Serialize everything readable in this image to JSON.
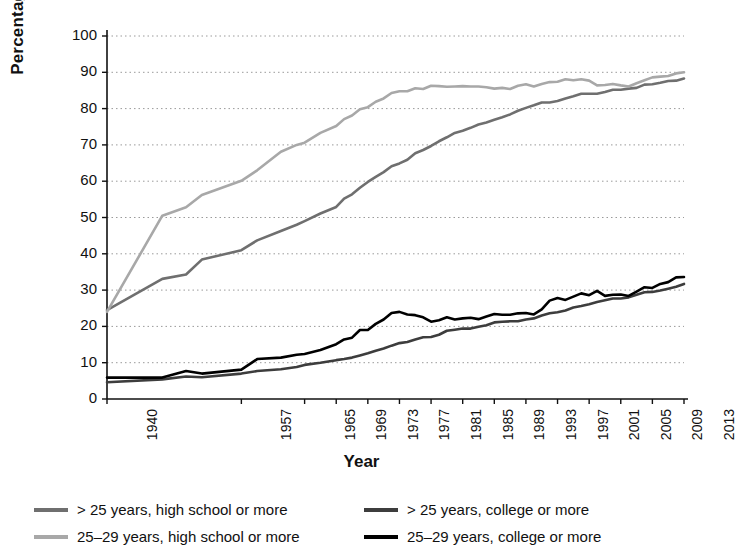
{
  "chart_data": {
    "type": "line",
    "title": "",
    "xlabel": "Year",
    "ylabel": "Percentage",
    "ylim": [
      0,
      100
    ],
    "ytick_labels": [
      "0",
      "10",
      "20",
      "30",
      "40",
      "50",
      "60",
      "70",
      "80",
      "90",
      "100"
    ],
    "ytick_values": [
      0,
      10,
      20,
      30,
      40,
      50,
      60,
      70,
      80,
      90,
      100
    ],
    "xtick_labels": [
      "1940",
      "1957",
      "1965",
      "1969",
      "1973",
      "1977",
      "1981",
      "1985",
      "1989",
      "1993",
      "1997",
      "2001",
      "2005",
      "2009",
      "2013"
    ],
    "xtick_values": [
      1940,
      1957,
      1965,
      1969,
      1973,
      1977,
      1981,
      1985,
      1989,
      1993,
      1997,
      2001,
      2005,
      2009,
      2013
    ],
    "xlim": [
      1940,
      2013
    ],
    "grid": "horizontal-dotted",
    "legend_position": "bottom",
    "series": [
      {
        "name": "> 25 years, high school or more",
        "color": "#6f6f6f",
        "x": [
          1940,
          1947,
          1950,
          1952,
          1957,
          1959,
          1962,
          1964,
          1965,
          1967,
          1969,
          1970,
          1971,
          1972,
          1973,
          1974,
          1975,
          1976,
          1977,
          1978,
          1979,
          1980,
          1981,
          1982,
          1983,
          1984,
          1985,
          1986,
          1987,
          1988,
          1989,
          1990,
          1991,
          1992,
          1993,
          1994,
          1995,
          1996,
          1997,
          1998,
          1999,
          2000,
          2001,
          2002,
          2003,
          2004,
          2005,
          2006,
          2007,
          2008,
          2009,
          2010,
          2011,
          2012,
          2013
        ],
        "values": [
          24.5,
          33.1,
          34.3,
          38.4,
          41.0,
          43.7,
          46.3,
          48.0,
          49.0,
          51.1,
          52.9,
          55.2,
          56.4,
          58.2,
          59.8,
          61.2,
          62.5,
          64.1,
          64.9,
          65.9,
          67.7,
          68.6,
          69.7,
          71.0,
          72.1,
          73.3,
          73.9,
          74.7,
          75.6,
          76.2,
          76.9,
          77.6,
          78.4,
          79.4,
          80.2,
          80.9,
          81.7,
          81.7,
          82.1,
          82.8,
          83.4,
          84.1,
          84.1,
          84.1,
          84.6,
          85.2,
          85.2,
          85.5,
          85.7,
          86.6,
          86.7,
          87.1,
          87.6,
          87.7,
          88.3
        ]
      },
      {
        "name": "25–29 years, high school or more",
        "color": "#a8a8a8",
        "x": [
          1940,
          1947,
          1950,
          1952,
          1957,
          1959,
          1962,
          1964,
          1965,
          1967,
          1969,
          1970,
          1971,
          1972,
          1973,
          1974,
          1975,
          1976,
          1977,
          1978,
          1979,
          1980,
          1981,
          1982,
          1983,
          1984,
          1985,
          1986,
          1987,
          1988,
          1989,
          1990,
          1991,
          1992,
          1993,
          1994,
          1995,
          1996,
          1997,
          1998,
          1999,
          2000,
          2001,
          2002,
          2003,
          2004,
          2005,
          2006,
          2007,
          2008,
          2009,
          2010,
          2011,
          2012,
          2013
        ],
        "values": [
          24.0,
          50.5,
          52.8,
          56.2,
          60.1,
          63.0,
          68.1,
          70.0,
          70.6,
          73.3,
          75.2,
          77.1,
          78.1,
          79.8,
          80.4,
          81.9,
          82.8,
          84.3,
          84.8,
          84.8,
          85.6,
          85.4,
          86.3,
          86.2,
          86.0,
          86.1,
          86.2,
          86.1,
          86.1,
          85.9,
          85.5,
          85.7,
          85.4,
          86.3,
          86.7,
          86.1,
          86.8,
          87.3,
          87.4,
          88.1,
          87.8,
          88.1,
          87.7,
          86.4,
          86.5,
          86.8,
          86.4,
          86.1,
          87.0,
          87.8,
          88.6,
          88.8,
          89.0,
          89.7,
          90.0
        ]
      },
      {
        "name": "> 25 years, college or more",
        "color": "#3d3d3d",
        "x": [
          1940,
          1947,
          1950,
          1952,
          1957,
          1959,
          1962,
          1964,
          1965,
          1967,
          1969,
          1970,
          1971,
          1972,
          1973,
          1974,
          1975,
          1976,
          1977,
          1978,
          1979,
          1980,
          1981,
          1982,
          1983,
          1984,
          1985,
          1986,
          1987,
          1988,
          1989,
          1990,
          1991,
          1992,
          1993,
          1994,
          1995,
          1996,
          1997,
          1998,
          1999,
          2000,
          2001,
          2002,
          2003,
          2004,
          2005,
          2006,
          2007,
          2008,
          2009,
          2010,
          2011,
          2012,
          2013
        ],
        "values": [
          4.6,
          5.4,
          6.2,
          6.0,
          7.0,
          7.7,
          8.2,
          8.8,
          9.4,
          10.0,
          10.7,
          11.0,
          11.4,
          12.0,
          12.6,
          13.3,
          13.9,
          14.7,
          15.4,
          15.7,
          16.4,
          17.0,
          17.1,
          17.7,
          18.8,
          19.1,
          19.4,
          19.4,
          19.9,
          20.3,
          21.1,
          21.3,
          21.4,
          21.4,
          21.9,
          22.2,
          23.0,
          23.6,
          23.9,
          24.4,
          25.2,
          25.6,
          26.1,
          26.7,
          27.2,
          27.7,
          27.7,
          28.0,
          28.7,
          29.4,
          29.5,
          29.9,
          30.4,
          30.9,
          31.7
        ]
      },
      {
        "name": "25–29 years, college or more",
        "color": "#000000",
        "x": [
          1940,
          1947,
          1950,
          1952,
          1957,
          1959,
          1962,
          1964,
          1965,
          1967,
          1969,
          1970,
          1971,
          1972,
          1973,
          1974,
          1975,
          1976,
          1977,
          1978,
          1979,
          1980,
          1981,
          1982,
          1983,
          1984,
          1985,
          1986,
          1987,
          1988,
          1989,
          1990,
          1991,
          1992,
          1993,
          1994,
          1995,
          1996,
          1997,
          1998,
          1999,
          2000,
          2001,
          2002,
          2003,
          2004,
          2005,
          2006,
          2007,
          2008,
          2009,
          2010,
          2011,
          2012,
          2013
        ],
        "values": [
          5.9,
          5.9,
          7.7,
          7.0,
          8.1,
          11.0,
          11.4,
          12.2,
          12.4,
          13.5,
          15.1,
          16.4,
          16.9,
          19.0,
          19.0,
          20.7,
          21.9,
          23.7,
          24.0,
          23.3,
          23.1,
          22.5,
          21.3,
          21.7,
          22.5,
          21.9,
          22.2,
          22.4,
          22.0,
          22.7,
          23.4,
          23.2,
          23.2,
          23.6,
          23.7,
          23.3,
          24.7,
          27.1,
          27.8,
          27.3,
          28.2,
          29.1,
          28.6,
          29.8,
          28.4,
          28.7,
          28.8,
          28.4,
          29.6,
          30.8,
          30.6,
          31.7,
          32.2,
          33.5,
          33.6
        ]
      }
    ]
  },
  "legend": {
    "items": [
      {
        "label": "> 25 years, high school or more",
        "color": "#6f6f6f"
      },
      {
        "label": "> 25 years, college or more",
        "color": "#3d3d3d"
      },
      {
        "label": "25–29 years, high school or more",
        "color": "#a8a8a8"
      },
      {
        "label": "25–29 years, college or more",
        "color": "#000000"
      }
    ]
  }
}
